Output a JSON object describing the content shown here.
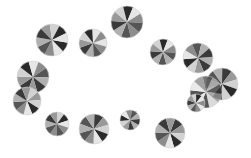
{
  "image": {
    "width": 251,
    "height": 158,
    "background": "#ffffff",
    "description": "Grayscale pinwheel discs arranged roughly in an elliptical ring"
  },
  "palette": [
    "#2a2a2a",
    "#e6e6e6",
    "#8c8c8c",
    "#555555",
    "#b0b0b0",
    "#3a3a3a",
    "#999999",
    "#d2d2d2"
  ],
  "discs": [
    {
      "cx": 52,
      "cy": 40,
      "r": 16,
      "rot": 10,
      "segments": 10
    },
    {
      "cx": 93,
      "cy": 43,
      "r": 14,
      "rot": -20,
      "segments": 10
    },
    {
      "cx": 127,
      "cy": 22,
      "r": 16,
      "rot": 40,
      "segments": 10
    },
    {
      "cx": 163,
      "cy": 52,
      "r": 13,
      "rot": 75,
      "segments": 10
    },
    {
      "cx": 198,
      "cy": 58,
      "r": 15,
      "rot": -5,
      "segments": 10
    },
    {
      "cx": 33,
      "cy": 77,
      "r": 16,
      "rot": 110,
      "segments": 10
    },
    {
      "cx": 27,
      "cy": 101,
      "r": 14,
      "rot": -40,
      "segments": 10
    },
    {
      "cx": 222,
      "cy": 84,
      "r": 16,
      "rot": 55,
      "segments": 10
    },
    {
      "cx": 206,
      "cy": 92,
      "r": 16,
      "rot": 150,
      "segments": 10,
      "opacity": 0.8
    },
    {
      "cx": 196,
      "cy": 103,
      "r": 9,
      "rot": 20,
      "segments": 10
    },
    {
      "cx": 57,
      "cy": 124,
      "r": 12,
      "rot": 90,
      "segments": 10
    },
    {
      "cx": 94,
      "cy": 129,
      "r": 15,
      "rot": 200,
      "segments": 10
    },
    {
      "cx": 130,
      "cy": 120,
      "r": 10,
      "rot": 30,
      "segments": 10
    },
    {
      "cx": 170,
      "cy": 133,
      "r": 15,
      "rot": -70,
      "segments": 10
    }
  ]
}
